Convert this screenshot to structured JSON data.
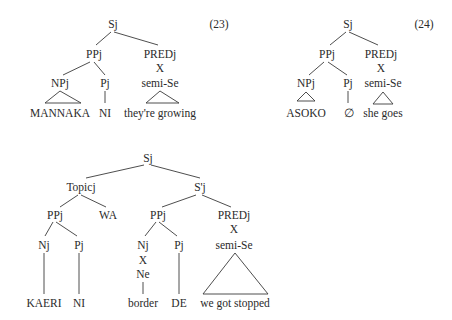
{
  "tree23": {
    "number": "(23)",
    "root": "Sj",
    "ppj": "PPj",
    "predj": "PREDj",
    "x": "X",
    "npj": "NPj",
    "pj": "Pj",
    "semi_se": "semi-Se",
    "leaf_np": "MANNAKA",
    "leaf_p": "NI",
    "leaf_semi": "they're growing"
  },
  "tree24": {
    "number": "(24)",
    "root": "Sj",
    "ppj": "PPj",
    "predj": "PREDj",
    "x": "X",
    "npj": "NPj",
    "pj": "Pj",
    "semi_se": "semi-Se",
    "leaf_np": "ASOKO",
    "leaf_p": "∅",
    "leaf_semi": "she goes"
  },
  "tree25": {
    "root": "Sj",
    "topic": "Topicj",
    "sprime": "S'j",
    "topic_pp": "PPj",
    "wa": "WA",
    "s_pp": "PPj",
    "predj": "PREDj",
    "pred_x": "X",
    "semi_se": "semi-Se",
    "topic_nj": "Nj",
    "topic_pj": "Pj",
    "s_nj": "Nj",
    "s_pj": "Pj",
    "nj_x": "X",
    "ne": "Ne",
    "leaf_kaeri": "KAERI",
    "leaf_ni": "NI",
    "leaf_border": "border",
    "leaf_de": "DE",
    "leaf_semi": "we got stopped"
  }
}
